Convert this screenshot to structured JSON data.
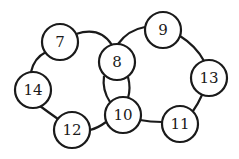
{
  "diagram": {
    "type": "two-interlocking-rings",
    "nodes": [
      {
        "id": "n7",
        "label": "7",
        "x": 60,
        "y": 42
      },
      {
        "id": "n8",
        "label": "8",
        "x": 117,
        "y": 62
      },
      {
        "id": "n9",
        "label": "9",
        "x": 163,
        "y": 30
      },
      {
        "id": "n13",
        "label": "13",
        "x": 209,
        "y": 78
      },
      {
        "id": "n11",
        "label": "11",
        "x": 180,
        "y": 124
      },
      {
        "id": "n10",
        "label": "10",
        "x": 123,
        "y": 115
      },
      {
        "id": "n12",
        "label": "12",
        "x": 72,
        "y": 130
      },
      {
        "id": "n14",
        "label": "14",
        "x": 33,
        "y": 90
      }
    ],
    "rings": [
      {
        "name": "left-ring",
        "members": [
          "7",
          "8",
          "10",
          "12",
          "14"
        ]
      },
      {
        "name": "right-ring",
        "members": [
          "8",
          "9",
          "13",
          "11",
          "10"
        ]
      }
    ],
    "node_radius": 18,
    "colors": {
      "stroke": "#1a1a1a",
      "fill": "#ffffff"
    }
  }
}
